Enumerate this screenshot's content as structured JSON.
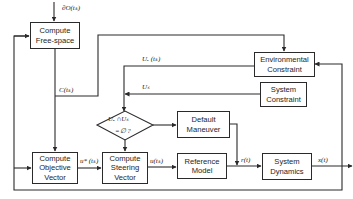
{
  "diagram": {
    "type": "control-flow block diagram",
    "blocks": {
      "compute_free_space": "Compute\nFree-space",
      "environmental_constraint": "Environmental\nConstraint",
      "system_constraint": "System\nConstraint",
      "default_maneuver": "Default\nManeuver",
      "compute_objective_vector": "Compute\nObjective\nVector",
      "compute_steering_vector": "Compute\nSteering\nVector",
      "reference_model": "Reference\nModel",
      "system_dynamics": "System\nDynamics"
    },
    "decision": {
      "line1": "Uₑ ∩Uₛ",
      "line2": "=∅  ?"
    },
    "signals": {
      "input_top": "∂O(tₖ)",
      "free_space_out": "C(tₖ)",
      "env_out": "Uₑ (tₖ)",
      "sys_out": "Uₛ",
      "objective_out": "u* (tₖ)",
      "steering_out": "u(tₖ)",
      "reference_out": "r(t)",
      "state_out": "x(t)"
    },
    "colors": {
      "line": "#2a2a2a",
      "background": "#ffffff"
    }
  }
}
